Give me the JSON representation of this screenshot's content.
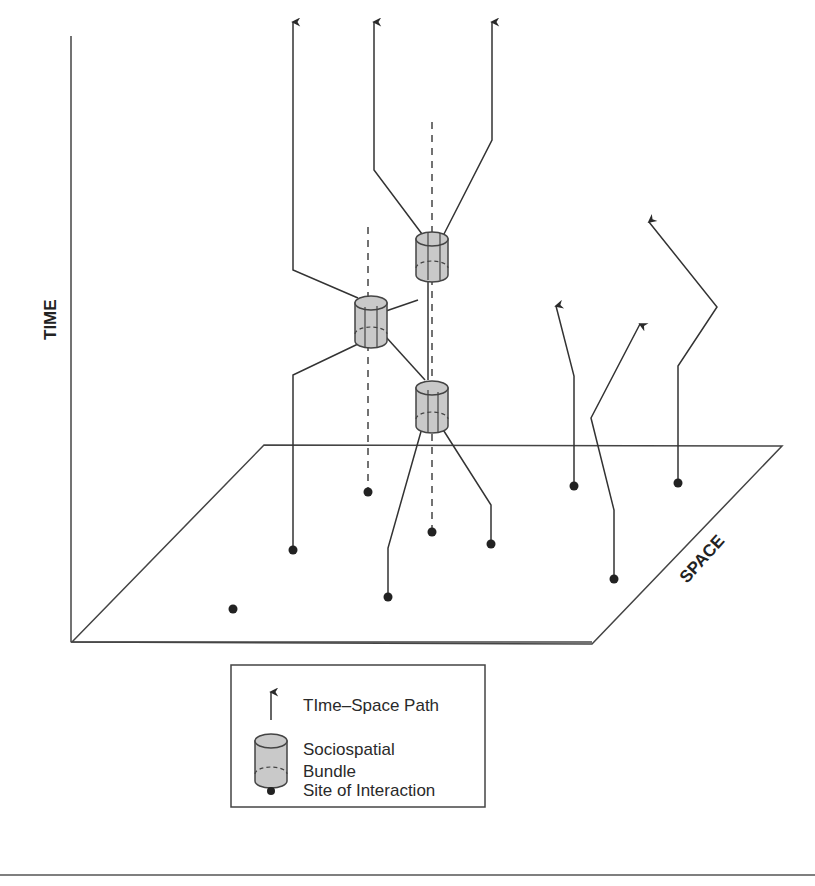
{
  "diagram": {
    "type": "time-geography diagram",
    "axes": {
      "vertical_label": "TIME",
      "depth_label": "SPACE"
    },
    "legend": {
      "items": [
        {
          "icon": "arrow-up-icon",
          "label": "TIme–Space Path"
        },
        {
          "icon": "cylinder-icon",
          "label_line1": "Sociospatial",
          "label_line2": "Bundle"
        },
        {
          "icon": "dot-icon",
          "label": "Site of Interaction"
        }
      ]
    },
    "elements": {
      "time_space_paths": 6,
      "sociospatial_bundles": 3,
      "sites_of_interaction": 9
    },
    "colors": {
      "line": "#333333",
      "bundle_fill": "#c8c8c8",
      "dot": "#222222"
    }
  }
}
